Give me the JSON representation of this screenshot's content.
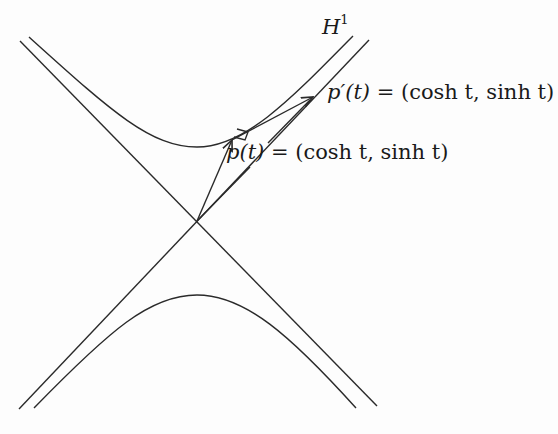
{
  "figure": {
    "stroke_color": "#2a2a2a",
    "background": "#fdfdfd"
  },
  "labels": {
    "curve_name": "H",
    "curve_superscript": "1",
    "tangent_name": "p′(t)",
    "tangent_value": " = (cosh t, sinh t)",
    "point_name": "p(t)",
    "point_value": " = (cosh t, sinh t)"
  },
  "geometry": {
    "origin": [
      197,
      221
    ],
    "asymptotes": [
      [
        [
          20,
          41
        ],
        [
          377,
          406
        ]
      ],
      [
        [
          369,
          40
        ],
        [
          19,
          409
        ]
      ]
    ],
    "upper_branch_vertex": [
      197,
      147
    ],
    "lower_branch_vertex": [
      197,
      295
    ],
    "point_p": [
      232,
      140
    ],
    "tangent_tip": [
      313,
      97
    ],
    "position_arrow_from_origin_tip": [
      310,
      100
    ]
  }
}
